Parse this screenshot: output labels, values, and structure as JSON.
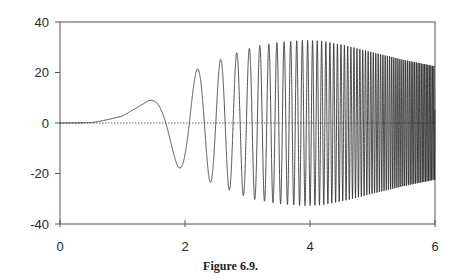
{
  "chart_data": {
    "type": "line",
    "title": "",
    "caption": "Figure 6.9.",
    "xlabel": "",
    "ylabel": "",
    "xlim": [
      0,
      6
    ],
    "ylim": [
      -40,
      40
    ],
    "x_ticks": [
      0,
      2,
      4,
      6
    ],
    "x_tick_labels": [
      "0",
      "2",
      "4",
      "6"
    ],
    "y_ticks": [
      40,
      20,
      0,
      -20,
      -40
    ],
    "y_tick_labels": [
      "40",
      "20",
      "0",
      "-20",
      "-40"
    ],
    "grid": false,
    "legend": null,
    "reference_line": {
      "y": 0,
      "style": "dotted"
    },
    "series": [
      {
        "name": "response",
        "description": "chirp-like oscillation; frequency increases with x, amplitude grows then decays",
        "peaks": [
          {
            "x": 1.33,
            "y": 7.5
          },
          {
            "x": 1.89,
            "y": -17.4
          },
          {
            "x": 2.2,
            "y": 21.4
          },
          {
            "x": 2.4,
            "y": -23.4
          },
          {
            "x": 2.59,
            "y": 25.3
          },
          {
            "x": 2.72,
            "y": -26.5
          },
          {
            "x": 2.85,
            "y": 28
          },
          {
            "x": 2.96,
            "y": -28.5
          },
          {
            "x": 3.06,
            "y": 30
          },
          {
            "x": 3.23,
            "y": 30.5
          }
        ],
        "envelope": {
          "x": [
            0,
            0.5,
            1.0,
            1.33,
            1.6,
            1.89,
            2.2,
            2.4,
            2.6,
            2.85,
            3.1,
            3.5,
            3.9,
            4.2,
            4.6,
            5.0,
            5.5,
            6.0
          ],
          "y": [
            0,
            0.3,
            3.0,
            7.5,
            12.5,
            17.5,
            21.4,
            23.4,
            25.5,
            28.0,
            30.2,
            32.0,
            32.8,
            32.5,
            30.5,
            28.0,
            25.0,
            22.5
          ]
        },
        "phase_model": {
          "c": 0.31,
          "power": 4,
          "offset": 0.6
        }
      }
    ]
  },
  "figure": {
    "caption": "Figure 6.9."
  }
}
